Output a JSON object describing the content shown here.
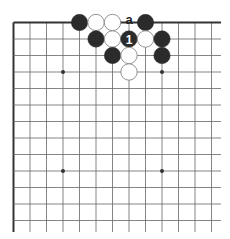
{
  "diagram": {
    "type": "go-board-fragment",
    "edges": [
      "top",
      "left"
    ],
    "visible_columns": 13,
    "visible_rows": 13,
    "colors": {
      "line": "#666666",
      "edge": "#333333",
      "black": "#2b2b2b",
      "white": "#ffffff",
      "white_stroke": "#888888",
      "label": "#222222",
      "number": "#ffffff"
    },
    "star_points": [
      {
        "col": 3,
        "row": 3
      },
      {
        "col": 9,
        "row": 3
      },
      {
        "col": 3,
        "row": 9
      },
      {
        "col": 9,
        "row": 9
      }
    ],
    "stones": [
      {
        "col": 4,
        "row": 0,
        "color": "black"
      },
      {
        "col": 5,
        "row": 0,
        "color": "white"
      },
      {
        "col": 6,
        "row": 0,
        "color": "white"
      },
      {
        "col": 8,
        "row": 0,
        "color": "black"
      },
      {
        "col": 5,
        "row": 1,
        "color": "black"
      },
      {
        "col": 6,
        "row": 1,
        "color": "white"
      },
      {
        "col": 7,
        "row": 1,
        "color": "black",
        "label": "1"
      },
      {
        "col": 8,
        "row": 1,
        "color": "white"
      },
      {
        "col": 9,
        "row": 1,
        "color": "black"
      },
      {
        "col": 6,
        "row": 2,
        "color": "black"
      },
      {
        "col": 7,
        "row": 2,
        "color": "white"
      },
      {
        "col": 9,
        "row": 2,
        "color": "black"
      },
      {
        "col": 7,
        "row": 3,
        "color": "white"
      }
    ],
    "point_labels": [
      {
        "col": 7,
        "row": 0,
        "text": "a"
      }
    ]
  }
}
